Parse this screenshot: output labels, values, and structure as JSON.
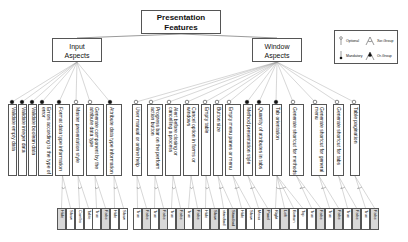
{
  "root": {
    "label_line1": "Presentation",
    "label_line2": "Features"
  },
  "groups": [
    {
      "label_line1": "Input",
      "label_line2": "Aspects"
    },
    {
      "label_line1": "Window",
      "label_line2": "Aspects"
    }
  ],
  "legend": {
    "optional": "Optional",
    "mandatory": "Mandatory",
    "xor_group": "Xor-Group",
    "or_group": "Or-Group"
  },
  "features": [
    {
      "label": "Validate empty data",
      "group": "input",
      "kind": "mandatory",
      "x": 8,
      "w": 9
    },
    {
      "label": "Validate integer data",
      "group": "input",
      "kind": "mandatory",
      "x": 18,
      "w": 9
    },
    {
      "label": "Validate boolean data",
      "group": "input",
      "kind": "mandatory",
      "x": 28,
      "w": 9
    },
    {
      "label": "Errors according to the type of error",
      "group": "input",
      "kind": "mandatory",
      "x": 38,
      "w": 15
    },
    {
      "label": "Format data type information",
      "group": "input",
      "kind": "mandatory",
      "x": 55,
      "w": 15
    },
    {
      "label": "Master presentation style",
      "group": "input",
      "kind": "optional",
      "x": 72,
      "w": 12
    },
    {
      "label": "Generate component by the attribute data type",
      "group": "input",
      "kind": "optional",
      "x": 86,
      "w": 18
    },
    {
      "label": "Attribute data type information",
      "group": "input",
      "kind": "mandatory",
      "x": 106,
      "w": 16
    },
    {
      "label": "User manual or online help",
      "group": "window",
      "kind": "optional",
      "x": 132,
      "w": 10
    },
    {
      "label": "Progress bar on the perform action button",
      "group": "window",
      "kind": "optional",
      "x": 147,
      "w": 16
    },
    {
      "label": "Alert before closing or cancelling a process",
      "group": "window",
      "kind": "optional",
      "x": 165,
      "w": 16
    },
    {
      "label": "Cancel option in forms or windows",
      "group": "window",
      "kind": "optional",
      "x": 183,
      "w": 16
    },
    {
      "label": "Empty table",
      "group": "window",
      "kind": "optional",
      "x": 201,
      "w": 10
    },
    {
      "label": "Button size",
      "group": "window",
      "kind": "optional",
      "x": 213,
      "w": 10
    },
    {
      "label": "Empty menu panes or menu",
      "group": "window",
      "kind": "optional",
      "x": 225,
      "w": 16
    },
    {
      "label": "Method presentation style",
      "group": "window",
      "kind": "mandatory",
      "x": 243,
      "w": 10
    },
    {
      "label": "Quantity of attributes in tabs",
      "group": "window",
      "kind": "mandatory",
      "x": 255,
      "w": 15
    },
    {
      "label": "Tab orientation",
      "group": "window",
      "kind": "mandatory",
      "x": 272,
      "w": 10
    },
    {
      "label": "Generate shortcut for methods",
      "group": "window",
      "kind": "optional",
      "x": 289,
      "w": 15
    },
    {
      "label": "Generate shortcut for general menu",
      "group": "window",
      "kind": "optional",
      "x": 311,
      "w": 16
    },
    {
      "label": "Generate shortcut for tabs",
      "group": "window",
      "kind": "optional",
      "x": 333,
      "w": 11
    },
    {
      "label": "Table pagination",
      "group": "window",
      "kind": "optional",
      "x": 350,
      "w": 10
    }
  ],
  "leaves": [
    {
      "label": "Hide",
      "x": 57,
      "parent": 4,
      "dark": true
    },
    {
      "label": "Show",
      "x": 66,
      "parent": 4,
      "dark": false
    },
    {
      "label": "Combo",
      "x": 75,
      "parent": 5,
      "dark": false
    },
    {
      "label": "Table",
      "x": 84,
      "parent": 5,
      "dark": false
    },
    {
      "label": "True",
      "x": 92,
      "parent": 6,
      "dark": false
    },
    {
      "label": "False",
      "x": 101,
      "parent": 6,
      "dark": true
    },
    {
      "label": "Hide",
      "x": 110,
      "parent": 7,
      "dark": false
    },
    {
      "label": "Show",
      "x": 119,
      "parent": 7,
      "dark": false
    },
    {
      "label": "True",
      "x": 133,
      "parent": 8,
      "dark": false
    },
    {
      "label": "False",
      "x": 142,
      "parent": 8,
      "dark": true
    },
    {
      "label": "True",
      "x": 150,
      "parent": 9,
      "dark": false
    },
    {
      "label": "False",
      "x": 159,
      "parent": 9,
      "dark": true
    },
    {
      "label": "True",
      "x": 167,
      "parent": 10,
      "dark": false
    },
    {
      "label": "False",
      "x": 176,
      "parent": 10,
      "dark": true
    },
    {
      "label": "True",
      "x": 184,
      "parent": 11,
      "dark": false
    },
    {
      "label": "False",
      "x": 193,
      "parent": 11,
      "dark": true
    },
    {
      "label": "Hide",
      "x": 201,
      "parent": 12,
      "dark": false
    },
    {
      "label": "Show",
      "x": 210,
      "parent": 12,
      "dark": true
    },
    {
      "label": "No standard",
      "x": 219,
      "parent": 13,
      "dark": false
    },
    {
      "label": "Standard",
      "x": 228,
      "parent": 13,
      "dark": true
    },
    {
      "label": "Hide",
      "x": 237,
      "parent": 14,
      "dark": false
    },
    {
      "label": "Show",
      "x": 246,
      "parent": 14,
      "dark": false
    },
    {
      "label": "Menu",
      "x": 254,
      "parent": 15,
      "dark": false
    },
    {
      "label": "Panel",
      "x": 263,
      "parent": 15,
      "dark": true
    },
    {
      "label": "Right",
      "x": 271,
      "parent": 17,
      "dark": false
    },
    {
      "label": "Left",
      "x": 280,
      "parent": 17,
      "dark": true
    },
    {
      "label": "Bottom",
      "x": 289,
      "parent": 17,
      "dark": false
    },
    {
      "label": "Top",
      "x": 298,
      "parent": 17,
      "dark": false
    },
    {
      "label": "True",
      "x": 307,
      "parent": 18,
      "dark": false
    },
    {
      "label": "False",
      "x": 316,
      "parent": 18,
      "dark": true
    },
    {
      "label": "True",
      "x": 325,
      "parent": 19,
      "dark": false
    },
    {
      "label": "False",
      "x": 334,
      "parent": 19,
      "dark": true
    },
    {
      "label": "True",
      "x": 343,
      "parent": 20,
      "dark": false
    },
    {
      "label": "False",
      "x": 352,
      "parent": 20,
      "dark": true
    },
    {
      "label": "True",
      "x": 361,
      "parent": 21,
      "dark": false
    },
    {
      "label": "False",
      "x": 370,
      "parent": 21,
      "dark": true
    }
  ]
}
